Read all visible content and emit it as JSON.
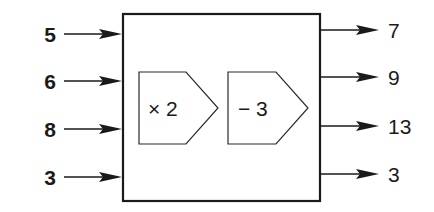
{
  "diagram": {
    "type": "function-machine",
    "inputs": [
      "5",
      "6",
      "8",
      "3"
    ],
    "operations": [
      {
        "symbol": "×",
        "operand": "2",
        "label": "× 2"
      },
      {
        "symbol": "−",
        "operand": "3",
        "label": "− 3"
      }
    ],
    "outputs": [
      "7",
      "9",
      "13",
      "3"
    ]
  }
}
